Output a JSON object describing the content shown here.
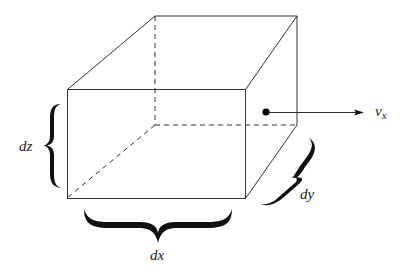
{
  "diagram": {
    "colors": {
      "stroke": "#333333",
      "brace": "#111111",
      "background": "#ffffff"
    },
    "labels": {
      "dx": "dx",
      "dy": "dy",
      "dz": "dz",
      "velocity_base": "v",
      "velocity_sub": "x"
    },
    "box": {
      "front": {
        "x1": 67,
        "y1": 89,
        "x2": 245,
        "y2": 198
      },
      "back": {
        "x1": 155,
        "y1": 16,
        "x2": 297,
        "y2": 125
      }
    },
    "point": {
      "x": 266,
      "y": 112
    },
    "arrow": {
      "x1": 270,
      "y1": 112,
      "x2": 362,
      "y2": 112
    }
  }
}
